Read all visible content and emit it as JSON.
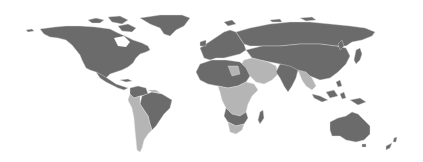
{
  "map": {
    "type": "choropleth-world",
    "background": "#ffffff",
    "legend_visible": false,
    "colors": {
      "category_a": "#6b6b6b",
      "category_b": "#b5b5b5"
    },
    "regions": [
      {
        "name": "north-america",
        "category": "category_a"
      },
      {
        "name": "greenland",
        "category": "category_a"
      },
      {
        "name": "central-america",
        "category": "category_a"
      },
      {
        "name": "brazil",
        "category": "category_a"
      },
      {
        "name": "colombia-venezuela",
        "category": "category_a"
      },
      {
        "name": "rest-of-south-america",
        "category": "category_b"
      },
      {
        "name": "europe",
        "category": "category_a"
      },
      {
        "name": "russia",
        "category": "category_a"
      },
      {
        "name": "china-central-asia",
        "category": "category_a"
      },
      {
        "name": "middle-east",
        "category": "category_b"
      },
      {
        "name": "india",
        "category": "category_a"
      },
      {
        "name": "southeast-asia",
        "category": "category_b"
      },
      {
        "name": "north-africa",
        "category": "category_a"
      },
      {
        "name": "central-africa",
        "category": "category_b"
      },
      {
        "name": "southern-africa",
        "category": "category_b"
      },
      {
        "name": "madagascar",
        "category": "category_a"
      },
      {
        "name": "indonesia",
        "category": "category_a"
      },
      {
        "name": "japan",
        "category": "category_a"
      },
      {
        "name": "australia",
        "category": "category_a"
      },
      {
        "name": "new-zealand",
        "category": "category_a"
      }
    ]
  }
}
